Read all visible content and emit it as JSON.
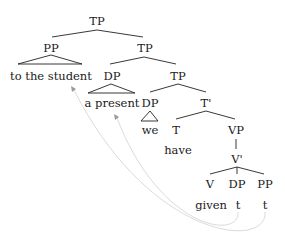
{
  "tree": {
    "nodes": {
      "tp_root": "TP",
      "pp_top": "PP",
      "pp_top_yield": "to the student",
      "tp_mid": "TP",
      "dp_present": "DP",
      "dp_present_yield": "a present",
      "tp_low": "TP",
      "dp_we": "DP",
      "dp_we_yield": "we",
      "t_bar": "T'",
      "t_head": "T",
      "t_head_yield": "have",
      "vp": "VP",
      "v_bar": "V'",
      "v_head": "V",
      "v_head_yield": "given",
      "dp_trace_cat": "DP",
      "dp_trace": "t",
      "pp_trace_cat": "PP",
      "pp_trace": "t"
    },
    "movements": [
      {
        "from": "pp_trace",
        "to": "pp_top_yield"
      },
      {
        "from": "dp_trace",
        "to": "dp_present_yield"
      }
    ],
    "colors": {
      "text": "#1a1a1a",
      "edges": "#222222",
      "movement_lines": "#d6d6d6",
      "arrowheads": "#9a9a9a"
    }
  }
}
